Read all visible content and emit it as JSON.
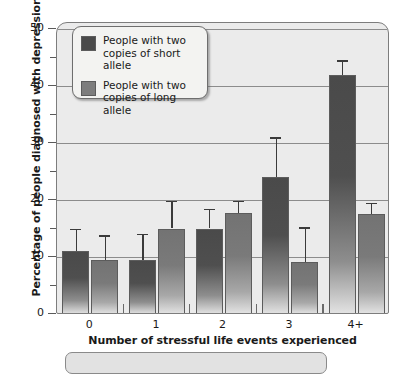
{
  "chart_data": {
    "type": "bar",
    "title": "",
    "xlabel": "Number of stressful life events experienced",
    "ylabel": "Percentage of people diagnosed with depression",
    "categories": [
      "0",
      "1",
      "2",
      "3",
      "4+"
    ],
    "ylim": [
      0,
      50
    ],
    "yticks": [
      0,
      10,
      20,
      30,
      40,
      50
    ],
    "ytick_labels": [
      "0",
      "10",
      "20",
      "30",
      "40",
      "50"
    ],
    "yminor_ticks": [
      5,
      15,
      25,
      35,
      45
    ],
    "grid": "horizontal",
    "legend_position": "upper-left-inside",
    "series": [
      {
        "name": "People with two copies of short allele",
        "color": "#4a4a4a",
        "values": [
          11,
          9.5,
          15,
          24,
          42
        ],
        "errors_upper": [
          15,
          14,
          18.5,
          31,
          44.5
        ],
        "errors_lower": [
          11,
          9.5,
          15,
          24,
          42
        ]
      },
      {
        "name": "People with two copies of long allele",
        "color": "#7d7d7d",
        "values": [
          9.5,
          15,
          17.8,
          9.2,
          17.5
        ],
        "errors_upper": [
          13.8,
          19.8,
          19.8,
          15.2,
          19.5
        ],
        "errors_lower": [
          9.5,
          15,
          17.8,
          9.2,
          17.5
        ]
      }
    ]
  },
  "legend": {
    "entries": [
      {
        "line1": "People with two",
        "line2": "copies of short allele",
        "swatch": "short"
      },
      {
        "line1": "People with two",
        "line2": "copies of long allele",
        "swatch": "long"
      }
    ]
  },
  "axes": {
    "y_title": "Percentage of people diagnosed with depression",
    "x_title": "Number of stressful life events experienced",
    "y_labels": [
      "50",
      "40",
      "30",
      "20",
      "10",
      "0"
    ],
    "x_labels": [
      "0",
      "1",
      "2",
      "3",
      "4+"
    ]
  },
  "colors": {
    "short_allele": "#4a4a4a",
    "long_allele": "#7d7d7d",
    "plot_background": "#ebebeb",
    "gridline": "#8c8c8c",
    "axis_line": "#7d7d7d"
  }
}
